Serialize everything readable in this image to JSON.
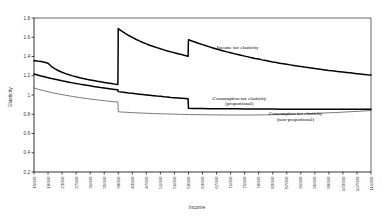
{
  "chart_data": {
    "type": "line",
    "title": "",
    "xlabel": "Income",
    "ylabel": "Elasticity",
    "xlim": [
      15000,
      111000
    ],
    "ylim": [
      0.2,
      1.8
    ],
    "grid": false,
    "legend_position": "inline-annotations",
    "ytick_labels": [
      "0.2",
      "0.4",
      "0.6",
      "0.8",
      "1",
      "1.2",
      "1.4",
      "1.6",
      "1.8"
    ],
    "ytick_values": [
      0.2,
      0.4,
      0.6,
      0.8,
      1.0,
      1.2,
      1.4,
      1.6,
      1.8
    ],
    "xtick_labels": [
      "15000",
      "19000",
      "23000",
      "27000",
      "31000",
      "35000",
      "39000",
      "43000",
      "47000",
      "51000",
      "55000",
      "59000",
      "63000",
      "67000",
      "71000",
      "75000",
      "79000",
      "83000",
      "87000",
      "91000",
      "95000",
      "99000",
      "103000",
      "107000",
      "111000"
    ],
    "xtick_values": [
      15000,
      19000,
      23000,
      27000,
      31000,
      35000,
      39000,
      43000,
      47000,
      51000,
      55000,
      59000,
      63000,
      67000,
      71000,
      75000,
      79000,
      83000,
      87000,
      91000,
      95000,
      99000,
      103000,
      107000,
      111000
    ],
    "annotations": [
      {
        "text": "Income tax elasticity",
        "x": 73000,
        "y": 1.48
      },
      {
        "text": "Consumption tax elasticity",
        "x": 73500,
        "y": 0.95
      },
      {
        "text": "(proportional)",
        "x": 73500,
        "y": 0.895
      },
      {
        "text": "Consumption tax elasticity",
        "x": 89500,
        "y": 0.79
      },
      {
        "text": "(non-proportional)",
        "x": 89500,
        "y": 0.735
      }
    ],
    "series": [
      {
        "name": "Income tax elasticity",
        "color": "#000000",
        "width": 1.5,
        "points": [
          [
            15000,
            1.355
          ],
          [
            16000,
            1.352
          ],
          [
            17000,
            1.347
          ],
          [
            18000,
            1.34
          ],
          [
            19000,
            1.33
          ],
          [
            20000,
            1.296
          ],
          [
            21000,
            1.272
          ],
          [
            22000,
            1.252
          ],
          [
            23000,
            1.236
          ],
          [
            24000,
            1.222
          ],
          [
            25000,
            1.21
          ],
          [
            26000,
            1.199
          ],
          [
            27000,
            1.189
          ],
          [
            28000,
            1.18
          ],
          [
            29000,
            1.172
          ],
          [
            30000,
            1.164
          ],
          [
            31000,
            1.157
          ],
          [
            32000,
            1.15
          ],
          [
            33000,
            1.143
          ],
          [
            34000,
            1.137
          ],
          [
            35000,
            1.131
          ],
          [
            36000,
            1.125
          ],
          [
            37000,
            1.119
          ],
          [
            38000,
            1.113
          ],
          [
            38900,
            1.108
          ],
          [
            39000,
            1.69
          ],
          [
            40000,
            1.664
          ],
          [
            41000,
            1.64
          ],
          [
            42000,
            1.618
          ],
          [
            43000,
            1.598
          ],
          [
            44000,
            1.579
          ],
          [
            45000,
            1.562
          ],
          [
            46000,
            1.546
          ],
          [
            47000,
            1.531
          ],
          [
            48000,
            1.517
          ],
          [
            49000,
            1.504
          ],
          [
            50000,
            1.492
          ],
          [
            51000,
            1.48
          ],
          [
            52000,
            1.469
          ],
          [
            53000,
            1.458
          ],
          [
            54000,
            1.448
          ],
          [
            55000,
            1.438
          ],
          [
            56000,
            1.429
          ],
          [
            57000,
            1.42
          ],
          [
            58000,
            1.411
          ],
          [
            58900,
            1.403
          ],
          [
            59000,
            1.575
          ],
          [
            60000,
            1.561
          ],
          [
            61000,
            1.548
          ],
          [
            62000,
            1.535
          ],
          [
            63000,
            1.523
          ],
          [
            64000,
            1.511
          ],
          [
            65000,
            1.5
          ],
          [
            66000,
            1.489
          ],
          [
            67000,
            1.478
          ],
          [
            68000,
            1.468
          ],
          [
            69000,
            1.458
          ],
          [
            70000,
            1.448
          ],
          [
            71000,
            1.439
          ],
          [
            72000,
            1.43
          ],
          [
            73000,
            1.421
          ],
          [
            74000,
            1.412
          ],
          [
            75000,
            1.404
          ],
          [
            76000,
            1.396
          ],
          [
            77000,
            1.388
          ],
          [
            78000,
            1.38
          ],
          [
            79000,
            1.373
          ],
          [
            80000,
            1.365
          ],
          [
            81000,
            1.358
          ],
          [
            82000,
            1.351
          ],
          [
            83000,
            1.344
          ],
          [
            84000,
            1.338
          ],
          [
            85000,
            1.331
          ],
          [
            86000,
            1.325
          ],
          [
            87000,
            1.319
          ],
          [
            88000,
            1.313
          ],
          [
            89000,
            1.307
          ],
          [
            90000,
            1.301
          ],
          [
            91000,
            1.296
          ],
          [
            92000,
            1.29
          ],
          [
            93000,
            1.285
          ],
          [
            94000,
            1.28
          ],
          [
            95000,
            1.275
          ],
          [
            96000,
            1.27
          ],
          [
            97000,
            1.265
          ],
          [
            98000,
            1.26
          ],
          [
            99000,
            1.255
          ],
          [
            100000,
            1.251
          ],
          [
            101000,
            1.246
          ],
          [
            102000,
            1.242
          ],
          [
            103000,
            1.238
          ],
          [
            104000,
            1.234
          ],
          [
            105000,
            1.23
          ],
          [
            106000,
            1.226
          ],
          [
            107000,
            1.222
          ],
          [
            108000,
            1.218
          ],
          [
            109000,
            1.214
          ],
          [
            110000,
            1.21
          ],
          [
            111000,
            1.207
          ]
        ]
      },
      {
        "name": "Consumption tax elasticity (proportional)",
        "color": "#000000",
        "width": 1.5,
        "points": [
          [
            15000,
            1.218
          ],
          [
            16000,
            1.208
          ],
          [
            17000,
            1.198
          ],
          [
            18000,
            1.189
          ],
          [
            19000,
            1.18
          ],
          [
            20000,
            1.171
          ],
          [
            21000,
            1.163
          ],
          [
            22000,
            1.155
          ],
          [
            23000,
            1.147
          ],
          [
            24000,
            1.14
          ],
          [
            25000,
            1.133
          ],
          [
            26000,
            1.126
          ],
          [
            27000,
            1.119
          ],
          [
            28000,
            1.113
          ],
          [
            29000,
            1.107
          ],
          [
            30000,
            1.101
          ],
          [
            31000,
            1.095
          ],
          [
            32000,
            1.089
          ],
          [
            33000,
            1.084
          ],
          [
            34000,
            1.078
          ],
          [
            35000,
            1.073
          ],
          [
            36000,
            1.068
          ],
          [
            37000,
            1.063
          ],
          [
            38000,
            1.058
          ],
          [
            38900,
            1.054
          ],
          [
            39000,
            1.035
          ],
          [
            40000,
            1.03
          ],
          [
            41000,
            1.026
          ],
          [
            42000,
            1.021
          ],
          [
            43000,
            1.017
          ],
          [
            44000,
            1.013
          ],
          [
            45000,
            1.009
          ],
          [
            46000,
            1.005
          ],
          [
            47000,
            1.001
          ],
          [
            48000,
            0.997
          ],
          [
            49000,
            0.993
          ],
          [
            50000,
            0.989
          ],
          [
            51000,
            0.986
          ],
          [
            52000,
            0.982
          ],
          [
            53000,
            0.979
          ],
          [
            54000,
            0.975
          ],
          [
            55000,
            0.972
          ],
          [
            56000,
            0.969
          ],
          [
            57000,
            0.966
          ],
          [
            58000,
            0.963
          ],
          [
            58900,
            0.96
          ],
          [
            59000,
            0.862
          ],
          [
            60000,
            0.861
          ],
          [
            61000,
            0.86
          ],
          [
            62000,
            0.86
          ],
          [
            63000,
            0.859
          ],
          [
            65000,
            0.858
          ],
          [
            67000,
            0.857
          ],
          [
            69000,
            0.857
          ],
          [
            71000,
            0.856
          ],
          [
            73000,
            0.856
          ],
          [
            75000,
            0.855
          ],
          [
            77000,
            0.855
          ],
          [
            79000,
            0.854
          ],
          [
            81000,
            0.854
          ],
          [
            83000,
            0.854
          ],
          [
            85000,
            0.853
          ],
          [
            87000,
            0.853
          ],
          [
            89000,
            0.853
          ],
          [
            91000,
            0.853
          ],
          [
            93000,
            0.853
          ],
          [
            95000,
            0.852
          ],
          [
            97000,
            0.852
          ],
          [
            99000,
            0.852
          ],
          [
            101000,
            0.852
          ],
          [
            103000,
            0.852
          ],
          [
            105000,
            0.852
          ],
          [
            107000,
            0.852
          ],
          [
            109000,
            0.852
          ],
          [
            111000,
            0.852
          ]
        ]
      },
      {
        "name": "Consumption tax elasticity (non-proportional)",
        "color": "#555555",
        "width": 0.8,
        "points": [
          [
            15000,
            1.073
          ],
          [
            16000,
            1.062
          ],
          [
            17000,
            1.052
          ],
          [
            18000,
            1.043
          ],
          [
            19000,
            1.034
          ],
          [
            20000,
            1.026
          ],
          [
            21000,
            1.018
          ],
          [
            22000,
            1.011
          ],
          [
            23000,
            1.004
          ],
          [
            24000,
            0.997
          ],
          [
            25000,
            0.991
          ],
          [
            26000,
            0.985
          ],
          [
            27000,
            0.979
          ],
          [
            28000,
            0.974
          ],
          [
            29000,
            0.968
          ],
          [
            30000,
            0.963
          ],
          [
            31000,
            0.958
          ],
          [
            32000,
            0.954
          ],
          [
            33000,
            0.949
          ],
          [
            34000,
            0.945
          ],
          [
            35000,
            0.941
          ],
          [
            36000,
            0.937
          ],
          [
            37000,
            0.933
          ],
          [
            38000,
            0.929
          ],
          [
            38900,
            0.926
          ],
          [
            39000,
            0.826
          ],
          [
            40000,
            0.823
          ],
          [
            41000,
            0.821
          ],
          [
            42000,
            0.819
          ],
          [
            43000,
            0.817
          ],
          [
            44000,
            0.815
          ],
          [
            45000,
            0.813
          ],
          [
            46000,
            0.812
          ],
          [
            47000,
            0.81
          ],
          [
            48000,
            0.809
          ],
          [
            49000,
            0.807
          ],
          [
            50000,
            0.806
          ],
          [
            51000,
            0.805
          ],
          [
            52000,
            0.804
          ],
          [
            53000,
            0.803
          ],
          [
            54000,
            0.802
          ],
          [
            55000,
            0.801
          ],
          [
            56000,
            0.8
          ],
          [
            57000,
            0.799
          ],
          [
            58000,
            0.798
          ],
          [
            59000,
            0.797
          ],
          [
            61000,
            0.796
          ],
          [
            63000,
            0.795
          ],
          [
            65000,
            0.794
          ],
          [
            67000,
            0.793
          ],
          [
            69000,
            0.793
          ],
          [
            71000,
            0.792
          ],
          [
            73000,
            0.792
          ],
          [
            75000,
            0.792
          ],
          [
            77000,
            0.792
          ],
          [
            79000,
            0.793
          ],
          [
            81000,
            0.794
          ],
          [
            83000,
            0.795
          ],
          [
            85000,
            0.797
          ],
          [
            87000,
            0.799
          ],
          [
            89000,
            0.801
          ],
          [
            91000,
            0.803
          ],
          [
            93000,
            0.806
          ],
          [
            95000,
            0.809
          ],
          [
            97000,
            0.812
          ],
          [
            99000,
            0.815
          ],
          [
            101000,
            0.818
          ],
          [
            103000,
            0.822
          ],
          [
            105000,
            0.826
          ],
          [
            107000,
            0.83
          ],
          [
            109000,
            0.834
          ],
          [
            111000,
            0.838
          ]
        ]
      }
    ]
  }
}
